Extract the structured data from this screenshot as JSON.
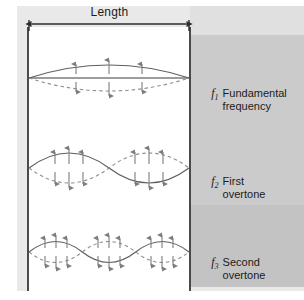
{
  "figure": {
    "dimension_label": "Length",
    "colors": {
      "outer_frame": "#e9e9e9",
      "panel_top": "#e0e0e0",
      "panel_mid": "#cbcbcb",
      "panel_bottom": "#c3c3c3",
      "wall": "#4a4a4a",
      "wave_solid": "#5a5a5a",
      "wave_dashed": "#8c8c8c",
      "arrow": "#7a7a7a",
      "axis": "#3c3c3c",
      "text": "#1b1b1b"
    }
  },
  "dimension_arrow": {
    "label": "Length",
    "left_tick_x": 29,
    "right_tick_x": 189,
    "y": 24
  },
  "modes": [
    {
      "id": "fundamental",
      "symbol": "f",
      "subscript": "1",
      "name_line1": "Fundamental",
      "name_line2": "frequency",
      "harmonic_number": 1,
      "antinodes": 1,
      "nodes": 2,
      "baseline_y": 78,
      "amplitude": 13,
      "arrow_count": 3
    },
    {
      "id": "first-overtone",
      "symbol": "f",
      "subscript": "2",
      "name_line1": "First",
      "name_line2": "overtone",
      "harmonic_number": 2,
      "antinodes": 2,
      "nodes": 3,
      "baseline_y": 168,
      "amplitude": 16,
      "arrow_count": 6
    },
    {
      "id": "second-overtone",
      "symbol": "f",
      "subscript": "3",
      "name_line1": "Second",
      "name_line2": "overtone",
      "harmonic_number": 3,
      "antinodes": 3,
      "nodes": 4,
      "baseline_y": 252,
      "amplitude": 17,
      "arrow_count": 9
    }
  ]
}
